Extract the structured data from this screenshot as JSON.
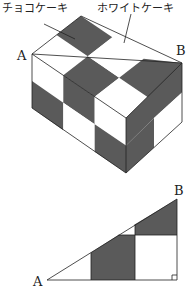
{
  "labels": {
    "choco": "チョコケーキ",
    "white": "ホワイトケーキ",
    "cube_a": "A",
    "cube_b": "B",
    "tri_a": "A",
    "tri_b": "B"
  },
  "colors": {
    "dark": "#5a5a5a",
    "light": "#ffffff",
    "line": "#222222"
  }
}
